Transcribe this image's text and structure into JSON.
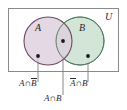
{
  "figure": {
    "type": "venn-diagram-two-sets",
    "universe_label": "U",
    "set_a_label": "A",
    "set_b_label": "B",
    "intersection_symbol": "∩",
    "colors": {
      "set_a_fill": "#ddd0dd",
      "set_a_stroke": "#6b4a63",
      "set_b_fill": "#cfe3d2",
      "set_b_stroke": "#4e7a5c",
      "universe_stroke": "#8a8a8a",
      "leader_line": "#7a7a7a",
      "dot": "#1a1a1a",
      "text": "#2a2a2a",
      "background": "#ffffff"
    },
    "regions": [
      {
        "name": "a-only",
        "label_parts": {
          "first": "A",
          "first_bar": false,
          "op": "∩",
          "second": "B",
          "second_bar": true
        },
        "label_text": "A ∩ B̄",
        "dot": {
          "x": 38,
          "y": 56
        },
        "leader_to": {
          "x": 38,
          "y": 82
        }
      },
      {
        "name": "intersection",
        "label_parts": {
          "first": "A",
          "first_bar": false,
          "op": "∩",
          "second": "B",
          "second_bar": false
        },
        "label_text": "A ∩ B",
        "dot": {
          "x": 63,
          "y": 41
        },
        "leader_to": {
          "x": 63,
          "y": 95
        }
      },
      {
        "name": "b-only",
        "label_parts": {
          "first": "A",
          "first_bar": true,
          "op": "∩",
          "second": "B",
          "second_bar": false
        },
        "label_text": "Ā ∩ B",
        "dot": {
          "x": 88,
          "y": 56
        },
        "leader_to": {
          "x": 88,
          "y": 82
        }
      }
    ]
  },
  "labels": {
    "universe": "U",
    "circle_a": "A",
    "circle_b": "B",
    "a_not_b_first": "A",
    "a_not_b_op": "∩",
    "a_not_b_second": "B",
    "a_and_b_first": "A",
    "a_and_b_op": "∩",
    "a_and_b_second": "B",
    "not_a_b_first": "A",
    "not_a_b_op": "∩",
    "not_a_b_second": "B"
  }
}
